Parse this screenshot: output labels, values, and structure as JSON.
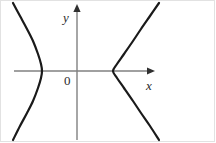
{
  "figure": {
    "background_color": "#ffffff",
    "border_color": "#e2e2e2",
    "width": 216,
    "height": 143
  },
  "axes": {
    "color": "#808080",
    "x_axis": {
      "label": "x",
      "y_pixel": 71,
      "start_x": 14,
      "end_x": 155,
      "arrow": "right"
    },
    "y_axis": {
      "label": "y",
      "x_pixel": 77,
      "start_y": 140,
      "end_y": 6,
      "arrow": "up"
    },
    "origin": {
      "label": "0",
      "x_pixel": 77,
      "y_pixel": 71
    }
  },
  "chart_data": {
    "type": "line",
    "title": "",
    "subtitle": "",
    "xlabel": "x",
    "ylabel": "y",
    "grid": false,
    "legend_position": "none",
    "curve_color": "#1a1a1a",
    "curve_width": 2.2,
    "xlim": [
      0,
      216
    ],
    "ylim": [
      143,
      0
    ],
    "origin_pixel": [
      77,
      71
    ],
    "vertices_pixel": [
      [
        42,
        71
      ],
      [
        113,
        71
      ]
    ],
    "series": [
      {
        "name": "left-branch",
        "opens": "left",
        "vertex_pixel": [
          42,
          71
        ],
        "points_pixel": [
          [
            13,
            3
          ],
          [
            20,
            16
          ],
          [
            27,
            29
          ],
          [
            33,
            41
          ],
          [
            38,
            54
          ],
          [
            41,
            64
          ],
          [
            42,
            71
          ],
          [
            41,
            78
          ],
          [
            38,
            88
          ],
          [
            33,
            101
          ],
          [
            27,
            113
          ],
          [
            20,
            126
          ],
          [
            13,
            140
          ]
        ]
      },
      {
        "name": "right-branch",
        "opens": "right",
        "vertex_pixel": [
          113,
          71
        ],
        "points_pixel": [
          [
            159,
            3
          ],
          [
            150,
            16
          ],
          [
            141,
            29
          ],
          [
            133,
            41
          ],
          [
            124,
            54
          ],
          [
            117,
            64
          ],
          [
            113,
            71
          ],
          [
            117,
            78
          ],
          [
            124,
            88
          ],
          [
            133,
            101
          ],
          [
            141,
            113
          ],
          [
            150,
            126
          ],
          [
            159,
            140
          ]
        ]
      }
    ]
  }
}
